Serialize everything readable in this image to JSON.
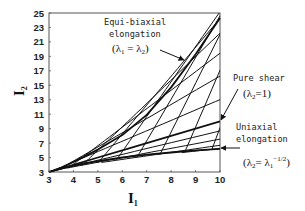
{
  "chart_data": {
    "type": "line",
    "title": "",
    "xlabel": "I1",
    "ylabel": "I2",
    "xlim": [
      3,
      10
    ],
    "ylim": [
      3,
      25
    ],
    "x_ticks": [
      3,
      4,
      5,
      6,
      7,
      8,
      9,
      10
    ],
    "y_ticks": [
      3,
      5,
      7,
      9,
      11,
      13,
      15,
      17,
      19,
      21,
      23,
      25
    ],
    "grid": false,
    "legend": null,
    "series": [
      {
        "name": "Equi-biaxial elongation",
        "condition": "λ1 = λ2",
        "points": [
          [
            3,
            3
          ],
          [
            3.5,
            3.6
          ],
          [
            4,
            4.4
          ],
          [
            5,
            6.1
          ],
          [
            6,
            8.1
          ],
          [
            7,
            10.9
          ],
          [
            8,
            14.7
          ],
          [
            9,
            19.3
          ],
          [
            10,
            24.3
          ]
        ]
      },
      {
        "name": "Pure shear",
        "condition": "λ2 = 1",
        "points": [
          [
            3,
            3
          ],
          [
            4,
            4
          ],
          [
            5,
            5
          ],
          [
            6,
            6
          ],
          [
            7,
            7
          ],
          [
            8,
            8
          ],
          [
            9,
            9
          ],
          [
            10,
            10
          ]
        ]
      },
      {
        "name": "Uniaxial elongation",
        "condition": "λ2 = λ1^(-1/2)",
        "points": [
          [
            3,
            3
          ],
          [
            4,
            3.9
          ],
          [
            5,
            4.5
          ],
          [
            6,
            5.0
          ],
          [
            7,
            5.4
          ],
          [
            8,
            5.7
          ],
          [
            9,
            6.0
          ],
          [
            10,
            6.2
          ]
        ]
      }
    ],
    "shaded_region": {
      "description": "Cross-hatched region of attainable deformation states between uniaxial and equi-biaxial curves",
      "pattern": "crosshatch"
    },
    "annotations": [
      {
        "lines": [
          "Equi-biaxial",
          "elongation",
          "(λ1 = λ2)"
        ],
        "points_to": "Equi-biaxial elongation"
      },
      {
        "lines": [
          "Pure shear",
          "(λ2=1)"
        ],
        "points_to": "Pure shear"
      },
      {
        "lines": [
          "Uniaxial",
          "elongation",
          "(λ2= λ1^-1/2)"
        ],
        "points_to": "Uniaxial elongation"
      }
    ]
  },
  "axes": {
    "x_title": "I",
    "x_title_sub": "1",
    "y_title": "I",
    "y_title_sub": "2",
    "x_tick_labels": [
      "3",
      "4",
      "5",
      "6",
      "7",
      "8",
      "9",
      "10"
    ],
    "y_tick_labels": [
      "25",
      "23",
      "21",
      "19",
      "17",
      "15",
      "13",
      "11",
      "9",
      "7",
      "5",
      "3"
    ]
  },
  "labels": {
    "equibiaxial_l1": "Equi-biaxial",
    "equibiaxial_l2": "elongation",
    "equibiaxial_l3_open": "(λ",
    "equibiaxial_l3_sub1": "1",
    "equibiaxial_l3_mid": " = λ",
    "equibiaxial_l3_sub2": "2",
    "equibiaxial_l3_close": ")",
    "pureshear_l1": "Pure shear",
    "pureshear_l2_open": "(λ",
    "pureshear_l2_sub": "2",
    "pureshear_l2_close": "=1)",
    "uniaxial_l1": "Uniaxial",
    "uniaxial_l2": "elongation",
    "uniaxial_l3_open": "(λ",
    "uniaxial_l3_sub": "2",
    "uniaxial_l3_mid": "= λ",
    "uniaxial_l3_sub2": "1",
    "uniaxial_l3_sup": "−1/2",
    "uniaxial_l3_close": ")"
  },
  "colors": {
    "line": "#111111",
    "frame": "#444444",
    "background": "#ffffff"
  }
}
